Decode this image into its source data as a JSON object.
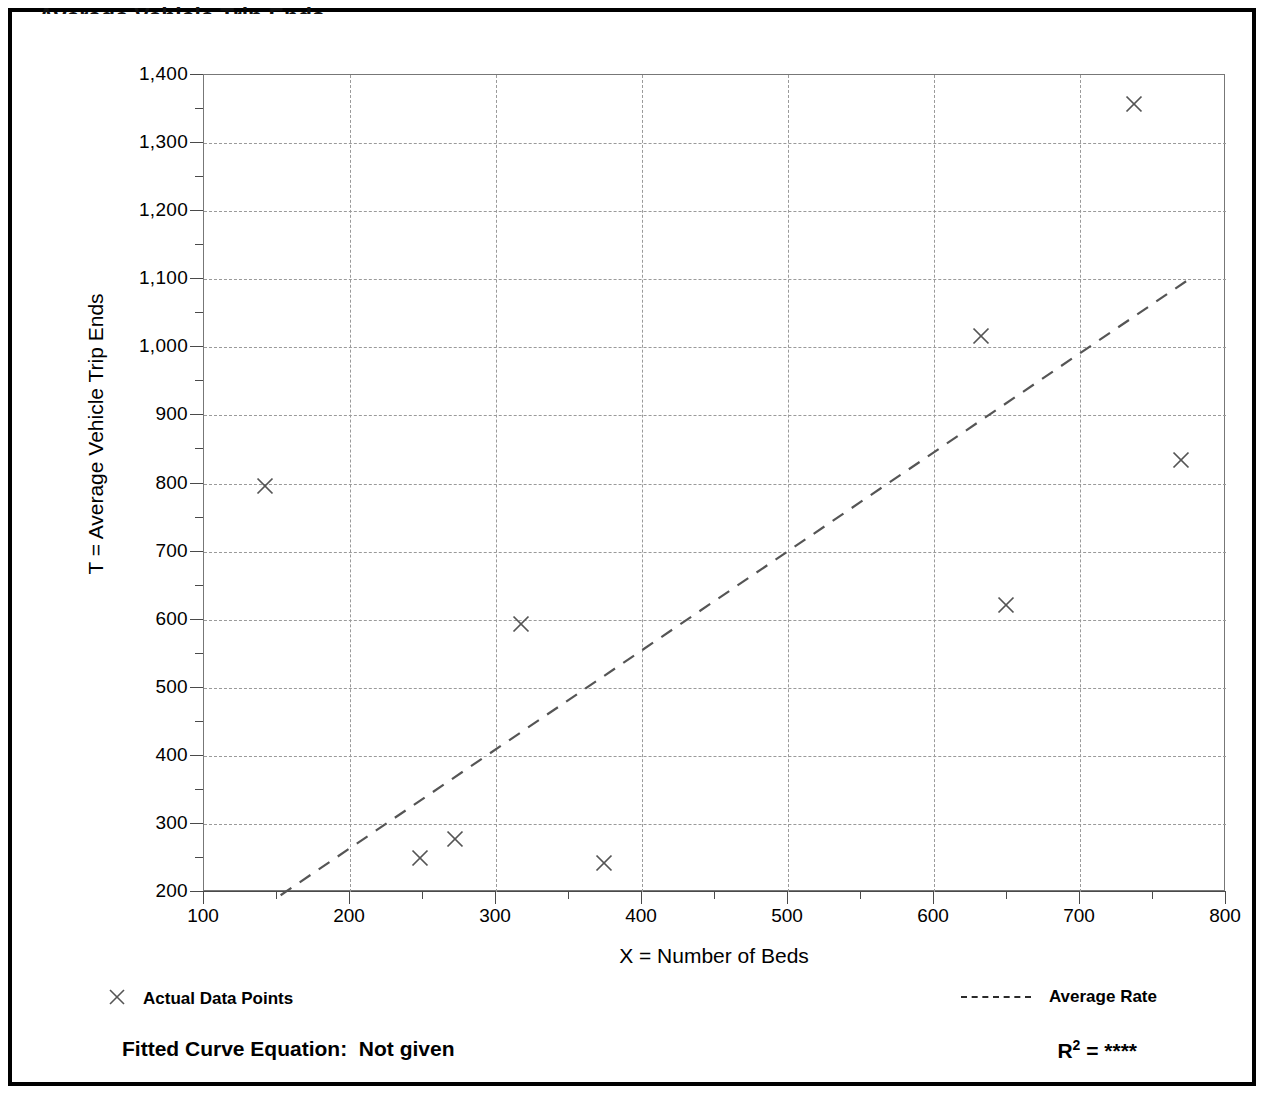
{
  "chart_data": {
    "type": "scatter",
    "title": "",
    "xlabel": "X = Number of Beds",
    "ylabel": "T = Average Vehicle Trip Ends",
    "xlim": [
      100,
      800
    ],
    "ylim": [
      200,
      1400
    ],
    "x_ticks": [
      100,
      200,
      300,
      400,
      500,
      600,
      700,
      800
    ],
    "y_ticks": [
      200,
      300,
      400,
      500,
      600,
      700,
      800,
      900,
      1000,
      1100,
      1200,
      1300,
      1400
    ],
    "x_tick_labels": [
      "100",
      "200",
      "300",
      "400",
      "500",
      "600",
      "700",
      "800"
    ],
    "y_tick_labels": [
      "200",
      "300",
      "400",
      "500",
      "600",
      "700",
      "800",
      "900",
      "1,000",
      "1,100",
      "1,200",
      "1,300",
      "1,400"
    ],
    "x_minor_step": 50,
    "y_minor_step": 50,
    "grid": true,
    "grid_style": "dotted",
    "legend_position": "below-plot",
    "series": [
      {
        "name": "Actual Data Points",
        "type": "scatter",
        "marker": "x",
        "color": "#555555",
        "points": [
          {
            "x": 142,
            "y": 797
          },
          {
            "x": 248,
            "y": 250
          },
          {
            "x": 272,
            "y": 278
          },
          {
            "x": 317,
            "y": 594
          },
          {
            "x": 374,
            "y": 243
          },
          {
            "x": 632,
            "y": 1016
          },
          {
            "x": 649,
            "y": 621
          },
          {
            "x": 737,
            "y": 1358
          },
          {
            "x": 769,
            "y": 835
          }
        ]
      },
      {
        "name": "Average Rate",
        "type": "line",
        "style": "dashed",
        "color": "#555555",
        "line_endpoints": [
          {
            "x": 147,
            "y": 207
          },
          {
            "x": 768,
            "y": 1110
          }
        ]
      }
    ],
    "annotations": {
      "fitted_curve_equation_label": "Fitted Curve Equation:",
      "fitted_curve_equation_value": "Not given",
      "r_squared_label": "R",
      "r_squared_exponent": "2",
      "r_squared_eq": "=",
      "r_squared_value": "****"
    }
  },
  "legend": {
    "data_points_label": "Actual Data Points",
    "average_rate_label": "Average Rate",
    "marker_icon": "x-marker-icon",
    "line_icon": "dashed-line-icon"
  },
  "footer": {
    "equation_text": "Fitted Curve Equation:  Not given",
    "r2_label": "R",
    "r2_sup": "2",
    "r2_equals": " = ",
    "r2_value": "****"
  },
  "page": {
    "clipped_heading": "Average Vehicle Trip Ends"
  }
}
